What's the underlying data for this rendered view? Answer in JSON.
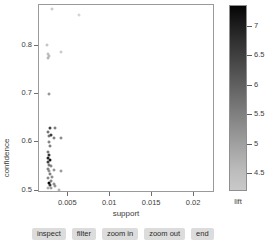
{
  "chart_data": {
    "type": "scatter",
    "title": "",
    "xlabel": "support",
    "ylabel": "confidence",
    "xlim": [
      0.0015,
      0.0225
    ],
    "ylim": [
      0.495,
      0.885
    ],
    "xticks": [
      0.005,
      0.01,
      0.015,
      0.02
    ],
    "xtick_labels": [
      "0.005",
      "0.01",
      "0.015",
      "0.02"
    ],
    "yticks": [
      0.5,
      0.6,
      0.7,
      0.8
    ],
    "ytick_labels": [
      "0.5",
      "0.6",
      "0.7",
      "0.8"
    ],
    "grid": false,
    "colorbar": {
      "label": "lift",
      "ticks": [
        4.5,
        5,
        5.5,
        6,
        6.5,
        7
      ],
      "tick_labels": [
        "4.5",
        "5",
        "5.5",
        "6",
        "6.5",
        "7"
      ],
      "vmin": 4.2,
      "vmax": 7.35,
      "low_color": "#c9c9c9",
      "high_color": "#050505"
    },
    "points": [
      {
        "support": 0.00315,
        "confidence": 0.875,
        "lift": 4.5
      },
      {
        "support": 0.0064,
        "confidence": 0.862,
        "lift": 4.3
      },
      {
        "support": 0.0026,
        "confidence": 0.8,
        "lift": 4.6
      },
      {
        "support": 0.00265,
        "confidence": 0.782,
        "lift": 4.7
      },
      {
        "support": 0.00285,
        "confidence": 0.777,
        "lift": 4.8
      },
      {
        "support": 0.0027,
        "confidence": 0.772,
        "lift": 4.9
      },
      {
        "support": 0.00425,
        "confidence": 0.785,
        "lift": 4.5
      },
      {
        "support": 0.00285,
        "confidence": 0.698,
        "lift": 5.6
      },
      {
        "support": 0.00295,
        "confidence": 0.628,
        "lift": 6.4
      },
      {
        "support": 0.00355,
        "confidence": 0.627,
        "lift": 6.1
      },
      {
        "support": 0.00275,
        "confidence": 0.62,
        "lift": 6.3
      },
      {
        "support": 0.0028,
        "confidence": 0.612,
        "lift": 6.2
      },
      {
        "support": 0.00345,
        "confidence": 0.608,
        "lift": 6.0
      },
      {
        "support": 0.003,
        "confidence": 0.614,
        "lift": 6.5
      },
      {
        "support": 0.00425,
        "confidence": 0.607,
        "lift": 5.8
      },
      {
        "support": 0.00285,
        "confidence": 0.598,
        "lift": 6.0
      },
      {
        "support": 0.0029,
        "confidence": 0.59,
        "lift": 6.1
      },
      {
        "support": 0.0027,
        "confidence": 0.578,
        "lift": 6.2
      },
      {
        "support": 0.00285,
        "confidence": 0.572,
        "lift": 6.6
      },
      {
        "support": 0.00275,
        "confidence": 0.566,
        "lift": 6.9
      },
      {
        "support": 0.0029,
        "confidence": 0.562,
        "lift": 7.1
      },
      {
        "support": 0.00265,
        "confidence": 0.557,
        "lift": 6.4
      },
      {
        "support": 0.0028,
        "confidence": 0.552,
        "lift": 6.2
      },
      {
        "support": 0.003,
        "confidence": 0.548,
        "lift": 5.9
      },
      {
        "support": 0.0027,
        "confidence": 0.543,
        "lift": 6.0
      },
      {
        "support": 0.00285,
        "confidence": 0.538,
        "lift": 5.7
      },
      {
        "support": 0.0034,
        "confidence": 0.54,
        "lift": 5.6
      },
      {
        "support": 0.0029,
        "confidence": 0.532,
        "lift": 6.1
      },
      {
        "support": 0.00425,
        "confidence": 0.538,
        "lift": 5.5
      },
      {
        "support": 0.00275,
        "confidence": 0.524,
        "lift": 5.9
      },
      {
        "support": 0.0032,
        "confidence": 0.526,
        "lift": 5.8
      },
      {
        "support": 0.003,
        "confidence": 0.518,
        "lift": 6.0
      },
      {
        "support": 0.0028,
        "confidence": 0.513,
        "lift": 7.3
      },
      {
        "support": 0.00335,
        "confidence": 0.512,
        "lift": 5.7
      },
      {
        "support": 0.0035,
        "confidence": 0.508,
        "lift": 5.6
      },
      {
        "support": 0.00265,
        "confidence": 0.503,
        "lift": 5.1
      },
      {
        "support": 0.004,
        "confidence": 0.5,
        "lift": 5.0
      },
      {
        "support": 0.0031,
        "confidence": 0.504,
        "lift": 5.4
      },
      {
        "support": 0.00295,
        "confidence": 0.509,
        "lift": 6.6
      }
    ]
  },
  "buttons": [
    {
      "label": "inspect"
    },
    {
      "label": "filter"
    },
    {
      "label": "zoom in"
    },
    {
      "label": "zoom out"
    },
    {
      "label": "end"
    }
  ]
}
